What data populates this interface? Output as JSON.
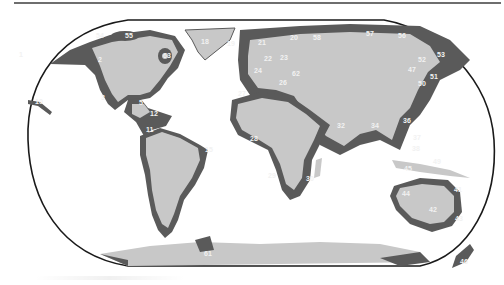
{
  "map": {
    "projection": "Robinson world map",
    "colors": {
      "land": "#c8c8c8",
      "lme_region": "#5a5a5a",
      "ocean": "#ffffff",
      "outline": "#1a1a1a",
      "label": "#f2f2f2"
    },
    "labels": [
      {
        "id": "1",
        "x": 19,
        "y": 57
      },
      {
        "id": "2",
        "x": 98,
        "y": 62
      },
      {
        "id": "3",
        "x": 101,
        "y": 100
      },
      {
        "id": "5",
        "x": 139,
        "y": 105
      },
      {
        "id": "11",
        "x": 146,
        "y": 132
      },
      {
        "id": "12",
        "x": 150,
        "y": 116
      },
      {
        "id": "10",
        "x": 35,
        "y": 104
      },
      {
        "id": "15",
        "x": 205,
        "y": 152
      },
      {
        "id": "21",
        "x": 258,
        "y": 45
      },
      {
        "id": "20",
        "x": 290,
        "y": 40
      },
      {
        "id": "22",
        "x": 264,
        "y": 61
      },
      {
        "id": "23",
        "x": 280,
        "y": 60
      },
      {
        "id": "24",
        "x": 254,
        "y": 73
      },
      {
        "id": "25",
        "x": 256,
        "y": 45
      },
      {
        "id": "26",
        "x": 279,
        "y": 85
      },
      {
        "id": "27",
        "x": 238,
        "y": 96
      },
      {
        "id": "28",
        "x": 250,
        "y": 141
      },
      {
        "id": "29",
        "x": 268,
        "y": 178
      },
      {
        "id": "30",
        "x": 306,
        "y": 181
      },
      {
        "id": "32",
        "x": 337,
        "y": 148
      },
      {
        "id": "34",
        "x": 371,
        "y": 126
      },
      {
        "id": "36",
        "x": 403,
        "y": 123
      },
      {
        "id": "37",
        "x": 413,
        "y": 138
      },
      {
        "id": "38",
        "x": 412,
        "y": 151
      },
      {
        "id": "41",
        "x": 454,
        "y": 192
      },
      {
        "id": "42",
        "x": 429,
        "y": 212
      },
      {
        "id": "43",
        "x": 455,
        "y": 221
      },
      {
        "id": "44",
        "x": 402,
        "y": 196
      },
      {
        "id": "45",
        "x": 404,
        "y": 171
      },
      {
        "id": "46",
        "x": 460,
        "y": 264
      },
      {
        "id": "47",
        "x": 408,
        "y": 72
      },
      {
        "id": "49",
        "x": 433,
        "y": 164
      },
      {
        "id": "50",
        "x": 418,
        "y": 86
      },
      {
        "id": "51",
        "x": 430,
        "y": 79
      },
      {
        "id": "52",
        "x": 418,
        "y": 62
      },
      {
        "id": "53",
        "x": 437,
        "y": 57
      },
      {
        "id": "54",
        "x": 96,
        "y": 38
      },
      {
        "id": "55",
        "x": 125,
        "y": 36
      },
      {
        "id": "56",
        "x": 398,
        "y": 38
      },
      {
        "id": "57",
        "x": 366,
        "y": 36
      },
      {
        "id": "58",
        "x": 313,
        "y": 40
      },
      {
        "id": "59",
        "x": 310,
        "y": 40
      },
      {
        "id": "61",
        "x": 204,
        "y": 256
      },
      {
        "id": "62",
        "x": 292,
        "y": 76
      },
      {
        "id": "63",
        "x": 163,
        "y": 55
      },
      {
        "id": "18",
        "x": 201,
        "y": 44
      },
      {
        "id": "19",
        "x": 227,
        "y": 46
      }
    ]
  }
}
